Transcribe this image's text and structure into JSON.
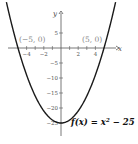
{
  "chart_data": {
    "type": "line",
    "title": "",
    "xlabel": "x",
    "ylabel": "y",
    "function": "f(x) = x^2 - 25",
    "function_label": {
      "prefix": "f(x) = x",
      "exponent": "2",
      "suffix": " − 25"
    },
    "xlim": [
      -6.5,
      6.5
    ],
    "ylim": [
      -30,
      12
    ],
    "x_ticks": [
      -4,
      -3,
      -2,
      -1,
      1,
      2,
      3,
      4
    ],
    "x_tick_labels": [
      "−4",
      "−2",
      "2",
      "4"
    ],
    "x_tick_label_values": [
      -4,
      -2,
      2,
      4
    ],
    "y_ticks": [
      5,
      -5,
      -10,
      -15,
      -20,
      -25
    ],
    "y_tick_labels": [
      "5",
      "−5",
      "−10",
      "−15",
      "−20",
      "−25"
    ],
    "annotations": [
      {
        "label": "(−5, 0)",
        "x": -5,
        "y": 0
      },
      {
        "label": "(5, 0)",
        "x": 5,
        "y": 0
      }
    ],
    "x": [
      -6.5,
      -6,
      -5,
      -4,
      -3,
      -2,
      -1,
      0,
      1,
      2,
      3,
      4,
      5,
      6,
      6.5
    ],
    "y": [
      17.25,
      11,
      0,
      -9,
      -16,
      -21,
      -24,
      -25,
      -24,
      -21,
      -16,
      -9,
      0,
      11,
      17.25
    ],
    "grid": false,
    "legend": null
  }
}
